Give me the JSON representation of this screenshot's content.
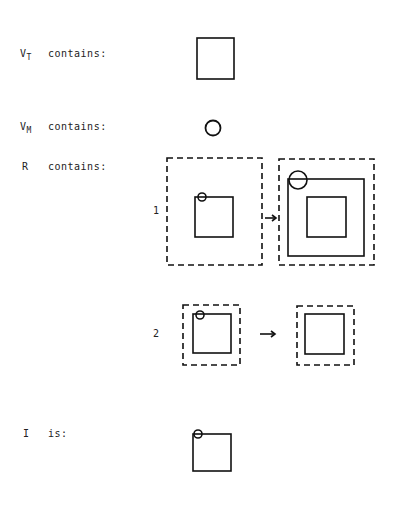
{
  "labels": {
    "vt_sym": "V",
    "vt_sub": "T",
    "vt_text": "contains:",
    "vm_sym": "V",
    "vm_sub": "M",
    "vm_text": "contains:",
    "r_sym": "R",
    "r_text": "contains:",
    "i_sym": "I",
    "i_text": "is:",
    "row1": "1",
    "row2": "2"
  },
  "colors": {
    "stroke": "#111111",
    "background": "#ffffff"
  }
}
